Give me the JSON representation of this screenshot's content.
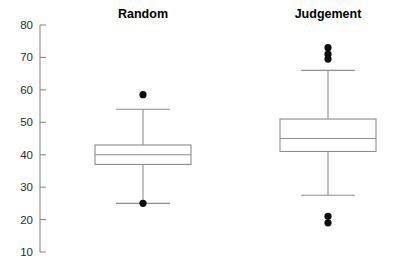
{
  "chart_data": {
    "type": "box",
    "title": "",
    "subtitle": "",
    "xlabel": "",
    "ylabel": "",
    "ylim": [
      10,
      80
    ],
    "yticks": [
      10,
      20,
      30,
      40,
      50,
      60,
      70,
      80
    ],
    "ytick_labels": [
      "10",
      "20",
      "30",
      "40",
      "50",
      "60",
      "70",
      "80"
    ],
    "grid": false,
    "legend": null,
    "categories": [
      "Random",
      "Judgement"
    ],
    "series": [
      {
        "name": "Random",
        "label": "Random",
        "whisker_low": 25,
        "q1": 37,
        "median": 40,
        "q3": 43,
        "whisker_high": 54,
        "outliers": [
          58.5,
          25
        ]
      },
      {
        "name": "Judgement",
        "label": "Judgement",
        "whisker_low": 27.5,
        "q1": 41,
        "median": 45,
        "q3": 51,
        "whisker_high": 66,
        "outliers": [
          73,
          71,
          69.5,
          21,
          19
        ]
      }
    ],
    "colors": {
      "box_fill": "#ffffff",
      "box_stroke": "#8e8e8e",
      "axis": "#8a8a8a",
      "outlier": "#0d0d0d",
      "tick_text": "#2b2b2b",
      "title_text": "#000000",
      "background": "#ffffff"
    }
  },
  "axis": {
    "y_top_value": 80,
    "y_bottom_value": 10,
    "y_top_px": 25,
    "y_bottom_px": 252,
    "axis_x_px": 40
  },
  "panels": [
    {
      "title": "Random",
      "center_px": 143,
      "box_half_width_px": 48,
      "title_x_px": 143,
      "title_y_px": 18
    },
    {
      "title": "Judgement",
      "center_px": 328,
      "box_half_width_px": 48,
      "title_x_px": 328,
      "title_y_px": 18
    }
  ]
}
